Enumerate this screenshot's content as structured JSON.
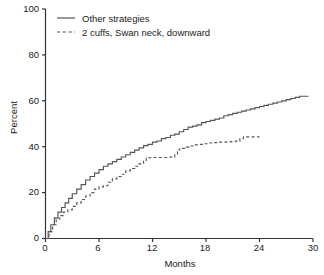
{
  "chart_data": {
    "type": "line",
    "title": "",
    "subtitle": "",
    "xlabel": "Months",
    "ylabel": "Percent",
    "xlim": [
      0,
      30
    ],
    "ylim": [
      0,
      100
    ],
    "xticks": [
      "0",
      "6",
      "12",
      "18",
      "24",
      "30"
    ],
    "yticks": [
      "0",
      "20",
      "40",
      "60",
      "80",
      "100"
    ],
    "grid": false,
    "legend_position": "top-left",
    "line_color": "#555555",
    "axis_color": "#333333",
    "series": [
      {
        "name": "Other strategies",
        "style": "solid",
        "x": [
          0,
          0.3,
          0.6,
          1.0,
          1.4,
          1.8,
          2.2,
          2.6,
          3.0,
          3.5,
          4.0,
          4.5,
          5.0,
          5.5,
          6.0,
          6.5,
          7.0,
          7.5,
          8.0,
          8.5,
          9.0,
          9.5,
          10.0,
          10.5,
          11.0,
          11.5,
          12.0,
          12.5,
          13.0,
          13.5,
          14.0,
          14.5,
          15.0,
          15.5,
          16.0,
          16.5,
          17.0,
          17.5,
          18.0,
          18.5,
          19.0,
          19.5,
          20.0,
          20.5,
          21.0,
          21.5,
          22.0,
          22.5,
          23.0,
          23.5,
          24.0,
          24.5,
          25.0,
          25.5,
          26.0,
          26.5,
          27.0,
          27.5,
          28.0,
          28.5,
          29.0,
          29.5
        ],
        "y": [
          0,
          3,
          6,
          9,
          11.5,
          13.5,
          15.5,
          17.5,
          19.5,
          21.5,
          23.5,
          25.5,
          27,
          28.5,
          30,
          31.5,
          32.5,
          33.5,
          34.5,
          35.5,
          36.5,
          37.5,
          38.5,
          39.5,
          40.5,
          41,
          42,
          42.5,
          43.5,
          44,
          45,
          45.5,
          46.5,
          47.5,
          48.5,
          49,
          49.5,
          50.5,
          51,
          51.5,
          52,
          52.5,
          53.5,
          54,
          54.5,
          55,
          55.5,
          56,
          56.5,
          57,
          57.5,
          58,
          58.5,
          59,
          59.5,
          60,
          60.5,
          61,
          61.5,
          62,
          62,
          62
        ]
      },
      {
        "name": "2 cuffs, Swan neck, downward",
        "style": "dashed",
        "x": [
          0,
          0.4,
          0.8,
          1.2,
          1.6,
          2.0,
          2.5,
          3.0,
          3.5,
          4.0,
          4.5,
          5.0,
          5.5,
          6.0,
          6.5,
          7.0,
          7.5,
          8.0,
          8.5,
          9.0,
          9.5,
          10.0,
          10.5,
          11.0,
          11.3,
          11.6,
          12.0,
          12.5,
          13.0,
          13.5,
          14.0,
          14.5,
          14.8,
          15.0,
          15.3,
          15.8,
          16.3,
          16.8,
          17.3,
          17.8,
          18.3,
          18.8,
          19.3,
          19.8,
          20.3,
          20.8,
          21.3,
          21.8,
          22.2,
          22.6,
          23.0,
          23.5,
          24.0
        ],
        "y": [
          0,
          3,
          6,
          8.5,
          10,
          11.5,
          12.5,
          14,
          15.5,
          17,
          18.5,
          20,
          21.5,
          22.5,
          23,
          24.5,
          26,
          27,
          28,
          29.5,
          30.5,
          31.5,
          32.5,
          34,
          35,
          35.2,
          35.3,
          35.3,
          35.3,
          35.3,
          35.5,
          36.5,
          38,
          39,
          39.3,
          39.8,
          40.3,
          40.8,
          41,
          41.3,
          41.6,
          41.8,
          42,
          42,
          42.1,
          42.2,
          42.4,
          43.5,
          44.3,
          44.3,
          44.3,
          44.3,
          44.3
        ]
      }
    ]
  },
  "legend": {
    "items": [
      {
        "label": "Other strategies",
        "style": "solid"
      },
      {
        "label": "2 cuffs, Swan neck, downward",
        "style": "dashed"
      }
    ]
  },
  "axes": {
    "y_title": "Percent",
    "x_title": "Months",
    "y_tick_0": "0",
    "y_tick_1": "20",
    "y_tick_2": "40",
    "y_tick_3": "60",
    "y_tick_4": "80",
    "y_tick_5": "100",
    "x_tick_0": "0",
    "x_tick_1": "6",
    "x_tick_2": "12",
    "x_tick_3": "18",
    "x_tick_4": "24",
    "x_tick_5": "30"
  }
}
